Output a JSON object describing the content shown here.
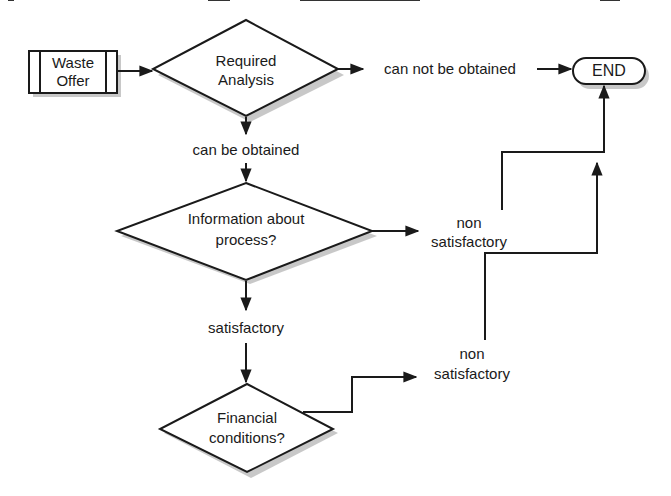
{
  "diagram": {
    "caption_fragment": "",
    "nodes": {
      "waste_offer": {
        "line1": "Waste",
        "line2": "Offer",
        "type": "predefined-process"
      },
      "required_analysis": {
        "line1": "Required",
        "line2": "Analysis",
        "type": "decision"
      },
      "end": {
        "label": "END",
        "type": "terminator"
      },
      "information_about_process": {
        "line1": "Information about",
        "line2": "process?",
        "type": "decision"
      },
      "financial_conditions": {
        "line1": "Financial",
        "line2": "conditions?",
        "type": "decision"
      }
    },
    "edge_labels": {
      "can_not_be_obtained": "can not be obtained",
      "can_be_obtained": "can be obtained",
      "satisfactory": "satisfactory",
      "non_satisfactory_1_line1": "non",
      "non_satisfactory_1_line2": "satisfactory",
      "non_satisfactory_2_line1": "non",
      "non_satisfactory_2_line2": "satisfactory"
    },
    "edges": [
      {
        "from": "Waste Offer",
        "to": "Required Analysis"
      },
      {
        "from": "Required Analysis",
        "to": "END",
        "label": "can not be obtained"
      },
      {
        "from": "Required Analysis",
        "to": "Information about process?",
        "label": "can be obtained"
      },
      {
        "from": "Information about process?",
        "to": "END",
        "label": "non satisfactory"
      },
      {
        "from": "Information about process?",
        "to": "Financial conditions?",
        "label": "satisfactory"
      },
      {
        "from": "Financial conditions?",
        "to": "END",
        "label": "non satisfactory"
      }
    ]
  }
}
